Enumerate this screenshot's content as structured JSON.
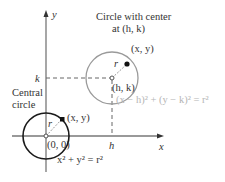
{
  "diagram": {
    "title_line1": "Circle with center",
    "title_line2": "at (h, k)",
    "axes": {
      "x_label": "x",
      "y_label": "y",
      "h_label": "h",
      "k_label": "k"
    },
    "central_circle": {
      "caption_line1": "Central",
      "caption_line2": "circle",
      "center_label": "(0, 0)",
      "point_label": "(x, y)",
      "radius_label": "r",
      "equation": "x² + y² = r²",
      "stroke_color": "#1a1a1a"
    },
    "translated_circle": {
      "center_label": "(h, k)",
      "point_label": "(x, y)",
      "radius_label": "r",
      "equation": "(x − h)² + (y − k)² = r²",
      "stroke_color": "#9a9a9a"
    },
    "colors": {
      "axis": "#777777",
      "text": "#333333",
      "light_text": "#b5b5b5"
    }
  }
}
